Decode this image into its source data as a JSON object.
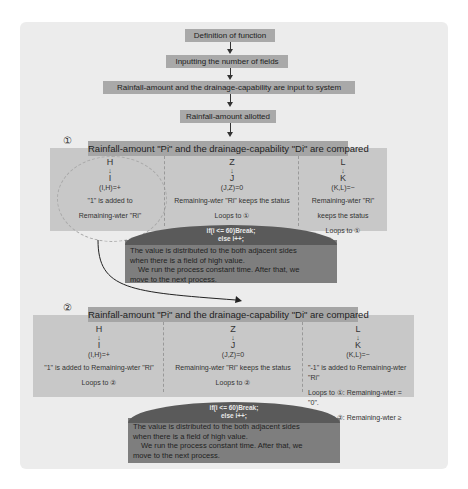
{
  "flow": {
    "steps": [
      "Definition of function",
      "Inputting the number of fields",
      "Rainfall-amount and the drainage-capability are input to system",
      "Rainfall-amount allotted"
    ]
  },
  "panel1": {
    "number": "①",
    "title": "Rainfall-amount \"Pi\" and the drainage-capability \"Di\" are compared",
    "columns": [
      {
        "symbols": [
          "H",
          "↓",
          "I"
        ],
        "relation": "(I,H)=+",
        "lines": [
          "\"1\" is added to",
          "Remaining-wter \"Ri\""
        ]
      },
      {
        "symbols": [
          "Z",
          "↓",
          "J"
        ],
        "relation": "(J,Z)=0",
        "lines": [
          "Remaining-wter \"Ri\" keeps the status",
          "Loops to ①"
        ]
      },
      {
        "symbols": [
          "L",
          "↓",
          "K"
        ],
        "relation": "(K,L)=−",
        "lines": [
          "Remaining-wter \"Ri\"",
          "keeps the status",
          "Loops to ①"
        ]
      }
    ],
    "condition": {
      "code_line1": "if(i <= 60)Break;",
      "code_line2": "else i++;",
      "text_line1": "The value is distributed to the both adjacent sides",
      "text_line2": "when there is a field of high value.",
      "text_line3": "We run the process constant time. After that, we",
      "text_line4": "move to the next process."
    }
  },
  "panel2": {
    "number": "②",
    "title": "Rainfall-amount \"Pi\" and the drainage-capability \"Di\" are compared",
    "columns": [
      {
        "symbols": [
          "H",
          "↓",
          "I"
        ],
        "relation": "(I,H)=+",
        "lines": [
          "\"1\" is added to Remaining-wter \"Ri\"",
          "Loops to ②"
        ]
      },
      {
        "symbols": [
          "Z",
          "↓",
          "J"
        ],
        "relation": "(J,Z)=0",
        "lines": [
          "Remaining-wter \"Ri\" keeps the status",
          "Loops to ②"
        ]
      },
      {
        "symbols": [
          "L",
          "↓",
          "K"
        ],
        "relation": "(K,L)=−",
        "lines": [
          "\"-1\" is added to Remaining-wter \"Ri\"",
          "Loops to ①: Remaining-wter = \"0\".",
          "Loops to ②: Remaining-wter ≥ \"1\"."
        ]
      }
    ],
    "condition": {
      "code_line1": "if(i <= 60)Break;",
      "code_line2": "else i++;",
      "text_line1": "The value is distributed to the both adjacent sides",
      "text_line2": "when there is a field of high value.",
      "text_line3": "We run the process constant time. After that, we",
      "text_line4": "move to the next process."
    }
  },
  "colors": {
    "canvas": "#ececec",
    "step_box": "#a9a9a9",
    "panel": "#c8c8c8",
    "panel_title": "#a5a5a5",
    "condition_box": "#7e7e7e",
    "condition_cap": "#5a5a5a"
  }
}
